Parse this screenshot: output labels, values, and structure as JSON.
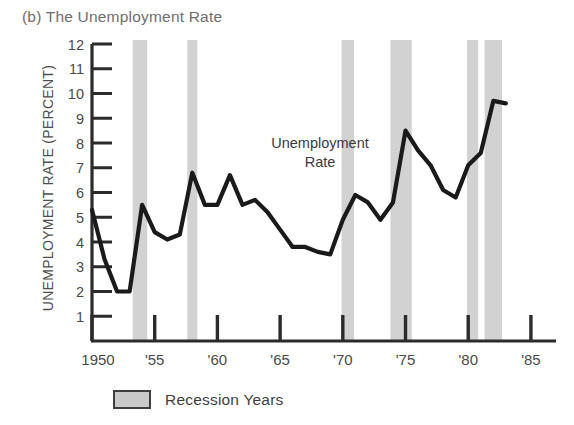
{
  "figure": {
    "panel_label": "(b)",
    "title": "(b) The Unemployment Rate",
    "background_color": "#ffffff"
  },
  "axes": {
    "y_axis_title": "UNEMPLOYMENT RATE (PERCENT)",
    "y_tick_labels": [
      "12",
      "11",
      "10",
      "9",
      "8",
      "7",
      "6",
      "5",
      "4",
      "3",
      "2",
      "1"
    ],
    "x_tick_labels": [
      "1950",
      "'55",
      "'60",
      "'65",
      "'70",
      "'75",
      "'80",
      "'85"
    ]
  },
  "annotation": {
    "line1": "Unemployment",
    "line2": "Rate"
  },
  "legend": {
    "label": "Recession Years",
    "swatch_color": "#c9c9c9",
    "swatch_border_color": "#3d3d3d"
  },
  "colors": {
    "line": "#1a1a1a",
    "recession_band": "#d2d2d2",
    "axis": "#2b2b2b",
    "title_text": "#6e6e6e",
    "label_text": "#4a4a4a"
  },
  "chart_data": {
    "type": "line",
    "title": "(b) The Unemployment Rate",
    "xlabel": "",
    "ylabel": "UNEMPLOYMENT RATE (PERCENT)",
    "xlim": [
      1950,
      1987
    ],
    "ylim": [
      0,
      12
    ],
    "grid": false,
    "legend_position": "below-axes",
    "x_ticks": [
      1950,
      1955,
      1960,
      1965,
      1970,
      1975,
      1980,
      1985
    ],
    "x_tick_labels": [
      "1950",
      "'55",
      "'60",
      "'65",
      "'70",
      "'75",
      "'80",
      "'85"
    ],
    "y_ticks": [
      1,
      2,
      3,
      4,
      5,
      6,
      7,
      8,
      9,
      10,
      11,
      12
    ],
    "series": [
      {
        "name": "Unemployment Rate",
        "color": "#1a1a1a",
        "x": [
          1950,
          1951,
          1952,
          1953,
          1954,
          1955,
          1956,
          1957,
          1958,
          1959,
          1960,
          1961,
          1962,
          1963,
          1964,
          1965,
          1966,
          1967,
          1968,
          1969,
          1970,
          1971,
          1972,
          1973,
          1974,
          1975,
          1976,
          1977,
          1978,
          1979,
          1980,
          1981,
          1982,
          1983
        ],
        "values": [
          5.3,
          3.3,
          2.0,
          2.0,
          5.5,
          4.4,
          4.1,
          4.3,
          6.8,
          5.5,
          5.5,
          6.7,
          5.5,
          5.7,
          5.2,
          4.5,
          3.8,
          3.8,
          3.6,
          3.5,
          4.9,
          5.9,
          5.6,
          4.9,
          5.6,
          8.5,
          7.7,
          7.1,
          6.1,
          5.8,
          7.1,
          7.6,
          9.7,
          9.6
        ],
        "unit": "percent"
      }
    ],
    "shaded_regions": [
      {
        "label": "Recession Years",
        "start": 1953.25,
        "end": 1954.4,
        "color": "#d2d2d2"
      },
      {
        "label": "Recession Years",
        "start": 1957.6,
        "end": 1958.4,
        "color": "#d2d2d2"
      },
      {
        "label": "Recession Years",
        "start": 1969.9,
        "end": 1970.9,
        "color": "#d2d2d2"
      },
      {
        "label": "Recession Years",
        "start": 1973.8,
        "end": 1975.5,
        "color": "#d2d2d2"
      },
      {
        "label": "Recession Years",
        "start": 1979.9,
        "end": 1980.8,
        "color": "#d2d2d2"
      },
      {
        "label": "Recession Years",
        "start": 1981.3,
        "end": 1982.7,
        "color": "#d2d2d2"
      }
    ]
  }
}
